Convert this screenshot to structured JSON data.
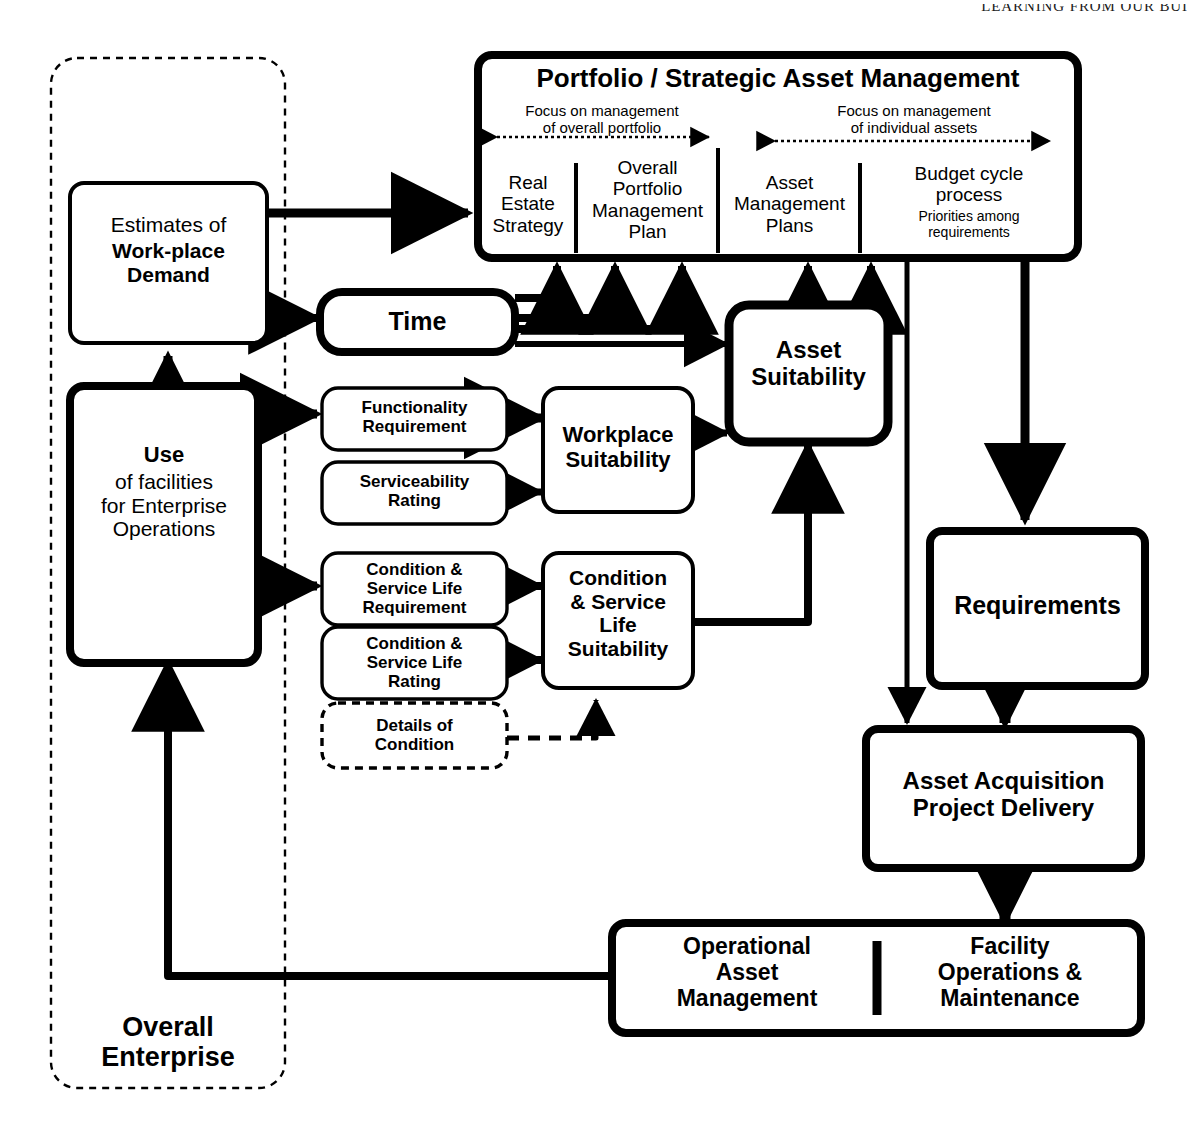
{
  "page": {
    "running_head": "LEARNING FROM OUR BUI"
  },
  "diagram": {
    "enclosure_label": "Overall\nEnterprise",
    "portfolio": {
      "title": "Portfolio / Strategic Asset Management",
      "span_left": "Focus on management\nof overall portfolio",
      "span_right": "Focus on management\nof individual assets",
      "columns": [
        {
          "label": "Real\nEstate\nStrategy"
        },
        {
          "label": "Overall\nPortfolio\nManagement\nPlan"
        },
        {
          "label": "Asset\nManagement\nPlans"
        },
        {
          "label": "Budget cycle\nprocess",
          "sub": "Priorities among\nrequirements"
        }
      ]
    },
    "boxes": [
      {
        "id": "estimates",
        "light": "Estimates of",
        "bold": "Work-place\nDemand"
      },
      {
        "id": "use",
        "bold": "Use",
        "light": "of facilities\nfor Enterprise\nOperations"
      },
      {
        "id": "time",
        "bold": "Time"
      },
      {
        "id": "functionality",
        "bold": "Functionality\nRequirement"
      },
      {
        "id": "serviceability",
        "bold": "Serviceability\nRating"
      },
      {
        "id": "workplace_suit",
        "bold": "Workplace\nSuitability"
      },
      {
        "id": "cond_req",
        "bold": "Condition &\nService Life\nRequirement"
      },
      {
        "id": "cond_rating",
        "bold": "Condition &\nService Life\nRating"
      },
      {
        "id": "details",
        "bold": "Details of\nCondition"
      },
      {
        "id": "cond_suit",
        "bold": "Condition\n& Service\nLife\nSuitability"
      },
      {
        "id": "asset_suit",
        "bold": "Asset\nSuitability"
      },
      {
        "id": "requirements",
        "bold": "Requirements"
      },
      {
        "id": "acquisition",
        "bold": "Asset Acquisition\nProject Delivery"
      },
      {
        "id": "oam",
        "bold": "Operational\nAsset\nManagement"
      },
      {
        "id": "fom",
        "bold": "Facility\nOperations &\nMaintenance"
      }
    ],
    "colors": {
      "stroke": "#000000",
      "fill": "#ffffff",
      "background": "#ffffff"
    }
  }
}
